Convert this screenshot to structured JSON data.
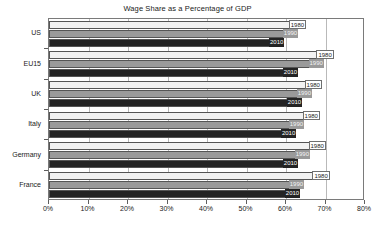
{
  "chart_data": {
    "type": "bar",
    "orientation": "horizontal",
    "title": "Wage Share as a Percentage of GDP",
    "xlabel": "",
    "ylabel": "",
    "xlim": [
      0,
      80
    ],
    "xticks": [
      "0%",
      "10%",
      "20%",
      "30%",
      "40%",
      "50%",
      "60%",
      "70%",
      "80%"
    ],
    "xtick_values": [
      0,
      10,
      20,
      30,
      40,
      50,
      60,
      70,
      80
    ],
    "grid": true,
    "legend": "none",
    "categories": [
      "US",
      "EU15",
      "UK",
      "Italy",
      "Germany",
      "France"
    ],
    "series": [
      {
        "name": "1980",
        "values": [
          65.0,
          72.0,
          69.0,
          68.5,
          70.0,
          71.0
        ]
      },
      {
        "name": "1990",
        "values": [
          63.0,
          69.5,
          66.5,
          64.5,
          66.0,
          64.5
        ]
      },
      {
        "name": "2010",
        "values": [
          59.5,
          63.0,
          64.0,
          62.5,
          63.0,
          63.5
        ]
      }
    ],
    "data_labels": [
      {
        "category": "US",
        "labels": [
          "1980",
          "1990",
          "2010"
        ]
      },
      {
        "category": "EU15",
        "labels": [
          "1980",
          "1990",
          "2010"
        ]
      },
      {
        "category": "UK",
        "labels": [
          "1980",
          "1990",
          "2010"
        ]
      },
      {
        "category": "Italy",
        "labels": [
          "1980",
          "1990",
          "2010"
        ]
      },
      {
        "category": "Germany",
        "labels": [
          "1980",
          "1990",
          "2010"
        ]
      },
      {
        "category": "France",
        "labels": [
          "1980",
          "1990",
          "2010"
        ]
      }
    ],
    "colors": {
      "series_1980": "#f2f2f2",
      "series_1990": "#9a9a9a",
      "series_2010": "#242424",
      "frame": "#7a7a7a",
      "grid": "#b9b9b9",
      "text": "#1a1a1a",
      "background": "#ffffff"
    }
  }
}
